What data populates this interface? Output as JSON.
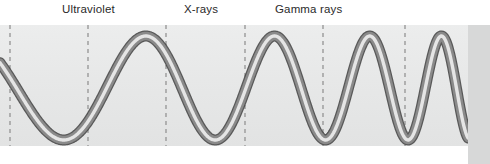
{
  "figure": {
    "width": 490,
    "height": 164,
    "background_color": "#ffffff",
    "band_color": "#e8e9e9",
    "right_panel_color": "#d7d8d8",
    "rule_color": "#3a3a3a"
  },
  "labels": [
    {
      "name": "ultraviolet",
      "text": "Ultraviolet",
      "x": 62,
      "color": "#2a2a2a"
    },
    {
      "name": "xrays",
      "text": "X-rays",
      "x": 184,
      "color": "#2a2a2a"
    },
    {
      "name": "gamma-rays",
      "text": "Gamma rays",
      "x": 275,
      "color": "#2a2a2a"
    }
  ],
  "dividers": {
    "name": "region-divider-lines",
    "style": "dashed",
    "color": "#9a9a9a",
    "x_positions": [
      10,
      88,
      166,
      245,
      323,
      405
    ],
    "y_top": 25,
    "y_bottom": 146
  },
  "chart_data": {
    "type": "line",
    "xlabel": "",
    "ylabel": "",
    "axis_ranges": {
      "xlim": [
        0,
        468
      ],
      "ylim": [
        27,
        150
      ]
    },
    "grid": false,
    "legend": "none",
    "wave": {
      "baseline_y": 88,
      "amplitude": 52,
      "stroke_color_light": "#f2f2f2",
      "stroke_color_dark": "#4a4a4a",
      "stroke_color_mid": "#8d8d8d",
      "peaks_x": [
        115,
        200,
        275,
        345,
        400,
        455
      ],
      "troughs_x": [
        55,
        160,
        240,
        310,
        372,
        425,
        480
      ],
      "wavelength_start": 210,
      "wavelength_end": 55
    },
    "series": [
      {
        "name": "wave",
        "x": [
          0,
          10,
          25,
          40,
          55,
          70,
          88,
          100,
          115,
          130,
          145,
          160,
          175,
          190,
          200,
          215,
          225,
          240,
          252,
          262,
          275,
          288,
          298,
          310,
          322,
          333,
          345,
          357,
          366,
          372,
          382,
          390,
          400,
          410,
          418,
          425,
          434,
          442,
          450,
          455,
          462,
          468
        ],
        "y": [
          50,
          62,
          84,
          110,
          140,
          118,
          78,
          52,
          32,
          52,
          96,
          140,
          110,
          56,
          30,
          62,
          110,
          142,
          102,
          52,
          30,
          64,
          116,
          142,
          96,
          48,
          30,
          72,
          124,
          142,
          88,
          46,
          30,
          78,
          128,
          142,
          84,
          44,
          32,
          29,
          62,
          96
        ]
      }
    ]
  }
}
